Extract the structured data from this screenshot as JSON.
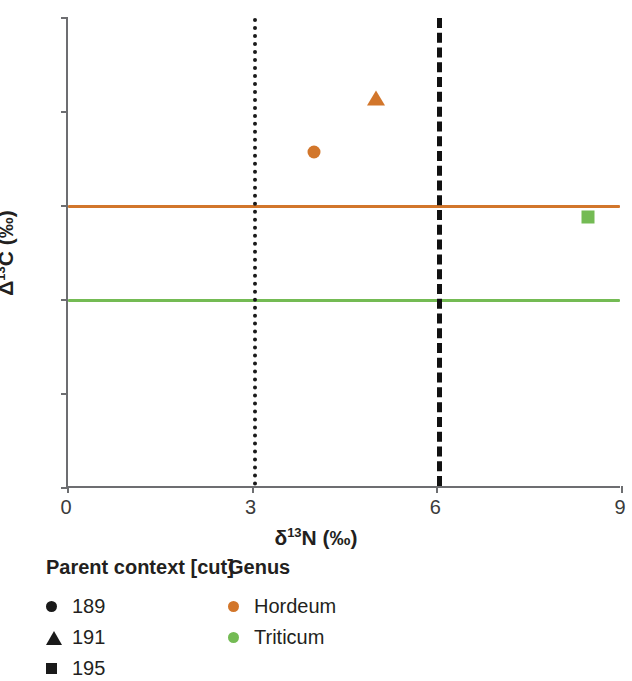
{
  "chart_data": {
    "type": "scatter",
    "title": "",
    "xlabel": "δ¹³N (‰)",
    "ylabel": "Δ¹³C (‰)",
    "xlim": [
      0,
      9
    ],
    "ylim": [
      15,
      20
    ],
    "xticks": [
      "0",
      "3",
      "6",
      "9"
    ],
    "xtick_values": [
      0,
      3,
      6,
      9
    ],
    "yticks": [
      "15",
      "16",
      "17",
      "18",
      "19",
      "20"
    ],
    "ytick_values": [
      15,
      16,
      17,
      18,
      19,
      20
    ],
    "grid": false,
    "legend_position": "below-left",
    "points": [
      {
        "x": 4.0,
        "y": 18.57,
        "genus": "Hordeum",
        "context": "189",
        "marker": "circle",
        "color": "#d2762b"
      },
      {
        "x": 5.0,
        "y": 19.17,
        "genus": "Hordeum",
        "context": "191",
        "marker": "triangle",
        "color": "#d2762b"
      },
      {
        "x": 8.45,
        "y": 17.88,
        "genus": "Triticum",
        "context": "195",
        "marker": "square",
        "color": "#74bb54"
      }
    ],
    "reference_lines": [
      {
        "orientation": "horizontal",
        "value": 18.0,
        "color": "#d2762b",
        "style": "solid",
        "label": "Hordeum baseline"
      },
      {
        "orientation": "horizontal",
        "value": 17.0,
        "color": "#74bb54",
        "style": "solid",
        "label": "Triticum baseline"
      },
      {
        "orientation": "vertical",
        "value": 3.0,
        "color": "#1a1a1a",
        "style": "dotted",
        "label": ""
      },
      {
        "orientation": "vertical",
        "value": 6.0,
        "color": "#111111",
        "style": "dashed",
        "label": ""
      }
    ],
    "series": [
      {
        "name": "Hordeum",
        "color": "#d2762b",
        "values": [
          [
            4.0,
            18.57
          ],
          [
            5.0,
            19.17
          ]
        ]
      },
      {
        "name": "Triticum",
        "color": "#74bb54",
        "values": [
          [
            8.45,
            17.88
          ]
        ]
      }
    ]
  },
  "legend": {
    "context": {
      "title": "Parent context [cut]",
      "items": [
        {
          "label": "189",
          "marker": "circle",
          "color": "#1a1a1a"
        },
        {
          "label": "191",
          "marker": "triangle",
          "color": "#1a1a1a"
        },
        {
          "label": "195",
          "marker": "square",
          "color": "#1a1a1a"
        }
      ]
    },
    "genus": {
      "title": "Genus",
      "items": [
        {
          "label": "Hordeum",
          "marker": "dot",
          "color": "#d2762b"
        },
        {
          "label": "Triticum",
          "marker": "dot",
          "color": "#74bb54"
        }
      ]
    }
  },
  "colors": {
    "hordeum": "#d2762b",
    "triticum": "#74bb54",
    "axis": "#6d6e71",
    "text": "#231f20",
    "tick_text": "#3b3b3b"
  }
}
